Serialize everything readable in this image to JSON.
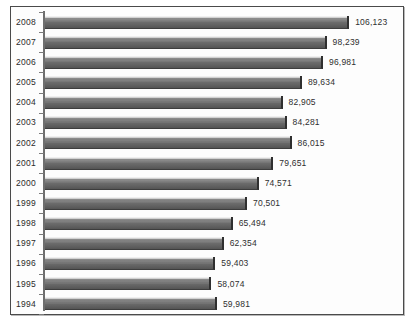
{
  "chart_data": {
    "type": "bar",
    "orientation": "horizontal",
    "title": "",
    "xlabel": "",
    "ylabel": "",
    "grid": false,
    "legend": null,
    "xlim": [
      0,
      112000
    ],
    "categories": [
      "2008",
      "2007",
      "2006",
      "2005",
      "2004",
      "2003",
      "2002",
      "2001",
      "2000",
      "1999",
      "1998",
      "1997",
      "1996",
      "1995",
      "1994"
    ],
    "values": [
      106123,
      98239,
      96981,
      89634,
      82905,
      84281,
      86015,
      79651,
      74571,
      70501,
      65494,
      62354,
      59403,
      58074,
      59981
    ],
    "value_labels": [
      "106,123",
      "98,239",
      "96,981",
      "89,634",
      "82,905",
      "84,281",
      "86,015",
      "79,651",
      "74,571",
      "70,501",
      "65,494",
      "62,354",
      "59,403",
      "58,074",
      "59,981"
    ]
  }
}
